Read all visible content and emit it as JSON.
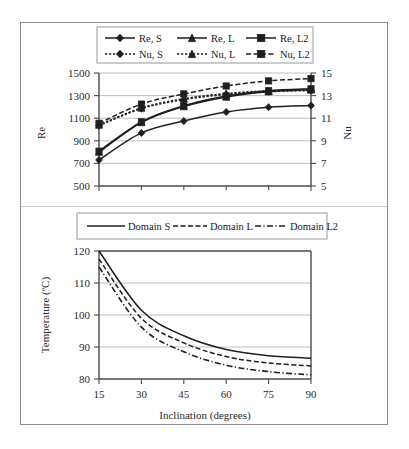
{
  "figure": {
    "panels": [
      "re-nu-panel",
      "temperature-panel"
    ]
  },
  "chart_data": [
    {
      "id": "top",
      "type": "line",
      "title": "",
      "xlabel": "",
      "ylabel": "Re",
      "y2label": "Nu",
      "x": [
        15,
        30,
        45,
        60,
        75,
        90
      ],
      "xlim": [
        15,
        90
      ],
      "ylim": [
        500,
        1500
      ],
      "yticks": [
        500,
        700,
        900,
        1100,
        1300,
        1500
      ],
      "y2lim": [
        5,
        15
      ],
      "y2ticks": [
        5,
        7,
        9,
        11,
        13,
        15
      ],
      "grid": true,
      "legend_position": "top",
      "series": [
        {
          "name": "Re, S",
          "axis": "left",
          "style": "solid",
          "marker": "diamond",
          "values": [
            730,
            970,
            1075,
            1155,
            1197,
            1212
          ]
        },
        {
          "name": "Re, L",
          "axis": "left",
          "style": "solid",
          "marker": "triangle",
          "values": [
            800,
            1062,
            1203,
            1288,
            1335,
            1352
          ]
        },
        {
          "name": "Re, L2",
          "axis": "left",
          "style": "solid",
          "marker": "square",
          "values": [
            808,
            1068,
            1210,
            1297,
            1343,
            1360
          ]
        },
        {
          "name": "Nu, S",
          "axis": "right",
          "style": "dotted",
          "marker": "diamond",
          "values": [
            10.35,
            11.85,
            12.65,
            13.1,
            13.35,
            13.45
          ]
        },
        {
          "name": "Nu, L",
          "axis": "right",
          "style": "dotted",
          "marker": "triangle",
          "values": [
            10.4,
            11.9,
            12.72,
            13.18,
            13.42,
            13.52
          ]
        },
        {
          "name": "Nu, L2",
          "axis": "right",
          "style": "dashed",
          "marker": "square",
          "values": [
            10.55,
            12.25,
            13.15,
            13.85,
            14.3,
            14.5
          ]
        }
      ]
    },
    {
      "id": "bottom",
      "type": "line",
      "title": "",
      "xlabel": "Inclination (degrees)",
      "ylabel": "Temperature (ºC)",
      "x": [
        15,
        30,
        45,
        60,
        75,
        90
      ],
      "xlim": [
        15,
        90
      ],
      "ylim": [
        80,
        120
      ],
      "yticks": [
        80,
        90,
        100,
        110,
        120
      ],
      "xticks": [
        15,
        30,
        45,
        60,
        75,
        90
      ],
      "grid": true,
      "legend_position": "top",
      "series": [
        {
          "name": "Domain S",
          "style": "solid",
          "values": [
            120.0,
            101.5,
            93.5,
            89.2,
            87.3,
            86.5
          ]
        },
        {
          "name": "Domain L",
          "style": "dashed",
          "values": [
            117.5,
            99.0,
            91.3,
            87.0,
            85.0,
            84.1
          ]
        },
        {
          "name": "Domain L2",
          "style": "dashdot",
          "values": [
            115.0,
            96.2,
            88.5,
            84.3,
            82.3,
            81.3
          ]
        }
      ]
    }
  ],
  "top_chart": {
    "ylabel": "Re",
    "y2label": "Nu",
    "yticks": [
      "500",
      "700",
      "900",
      "1100",
      "1300",
      "1500"
    ],
    "y2ticks": [
      "5",
      "7",
      "9",
      "11",
      "13",
      "15"
    ],
    "legend": [
      "Re, S",
      "Re, L",
      "Re, L2",
      "Nu, S",
      "Nu, L",
      "Nu, L2"
    ]
  },
  "bottom_chart": {
    "ylabel": "Temperature (ºC)",
    "xlabel": "Inclination (degrees)",
    "yticks": [
      "80",
      "90",
      "100",
      "110",
      "120"
    ],
    "xticks": [
      "15",
      "30",
      "45",
      "60",
      "75",
      "90"
    ],
    "legend": [
      "Domain S",
      "Domain L",
      "Domain L2"
    ]
  }
}
